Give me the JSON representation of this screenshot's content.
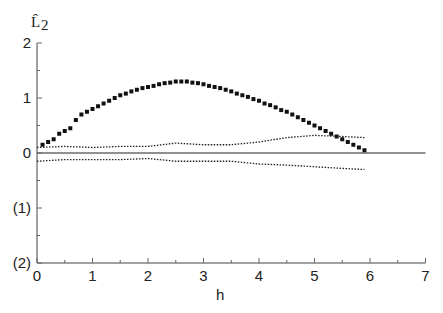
{
  "chart_data": {
    "type": "scatter",
    "title": "",
    "xlabel": "h",
    "ylabel": "L̂₂",
    "xlim": [
      0,
      7
    ],
    "ylim": [
      -2,
      2
    ],
    "x_ticks": [
      "0",
      "1",
      "2",
      "3",
      "4",
      "5",
      "6",
      "7"
    ],
    "y_ticks": [
      "2",
      "1",
      "0",
      "(1)",
      "(2)"
    ],
    "grid": false,
    "legend": null,
    "series": [
      {
        "name": "L2 estimate",
        "style": "square-markers",
        "x": [
          0.1,
          0.2,
          0.3,
          0.4,
          0.5,
          0.6,
          0.7,
          0.8,
          0.9,
          1.0,
          1.1,
          1.2,
          1.3,
          1.4,
          1.5,
          1.6,
          1.7,
          1.8,
          1.9,
          2.0,
          2.1,
          2.2,
          2.3,
          2.4,
          2.5,
          2.6,
          2.7,
          2.8,
          2.9,
          3.0,
          3.1,
          3.2,
          3.3,
          3.4,
          3.5,
          3.6,
          3.7,
          3.8,
          3.9,
          4.0,
          4.1,
          4.2,
          4.3,
          4.4,
          4.5,
          4.6,
          4.7,
          4.8,
          4.9,
          5.0,
          5.1,
          5.2,
          5.3,
          5.4,
          5.5,
          5.6,
          5.7,
          5.8,
          5.9
        ],
        "y": [
          0.15,
          0.2,
          0.25,
          0.35,
          0.4,
          0.45,
          0.6,
          0.7,
          0.75,
          0.8,
          0.85,
          0.9,
          0.95,
          1.0,
          1.05,
          1.08,
          1.12,
          1.15,
          1.18,
          1.2,
          1.22,
          1.25,
          1.27,
          1.28,
          1.3,
          1.3,
          1.3,
          1.28,
          1.27,
          1.25,
          1.22,
          1.2,
          1.18,
          1.15,
          1.12,
          1.08,
          1.05,
          1.02,
          0.98,
          0.95,
          0.9,
          0.87,
          0.83,
          0.78,
          0.75,
          0.7,
          0.65,
          0.6,
          0.55,
          0.5,
          0.45,
          0.4,
          0.35,
          0.3,
          0.25,
          0.2,
          0.15,
          0.1,
          0.05
        ]
      },
      {
        "name": "upper envelope",
        "style": "dotted-line",
        "x": [
          0,
          0.5,
          1,
          1.5,
          2,
          2.5,
          3,
          3.5,
          4,
          4.5,
          5,
          5.5,
          5.9
        ],
        "y": [
          0.1,
          0.12,
          0.1,
          0.12,
          0.12,
          0.18,
          0.15,
          0.15,
          0.2,
          0.28,
          0.32,
          0.3,
          0.28
        ]
      },
      {
        "name": "lower envelope",
        "style": "dotted-line",
        "x": [
          0,
          0.5,
          1,
          1.5,
          2,
          2.5,
          3,
          3.5,
          4,
          4.5,
          5,
          5.5,
          5.9
        ],
        "y": [
          -0.15,
          -0.12,
          -0.12,
          -0.12,
          -0.1,
          -0.15,
          -0.15,
          -0.15,
          -0.2,
          -0.22,
          -0.25,
          -0.28,
          -0.3
        ]
      }
    ],
    "reference_lines": [
      {
        "y": 0,
        "style": "solid"
      }
    ]
  },
  "axes": {
    "ylabel": "L̂",
    "ylabel_sub": "2",
    "xlabel": "h"
  }
}
